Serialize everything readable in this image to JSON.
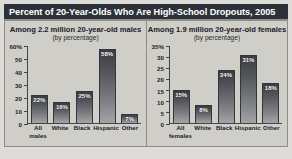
{
  "header": {
    "title": "Percent of 20-Year-Olds Who Are High-School Dropouts, 2005",
    "background_color": "#2d3138",
    "text_color": "#ffffff"
  },
  "figure": {
    "background_color": "#dddcd8",
    "panel_background_color": "#cfcec9",
    "border_color": "#8d8c87",
    "bar_color_top": "#3b3d42",
    "bar_color_bottom": "#a2a4a7",
    "axis_color": "#45464a"
  },
  "chart_data": [
    {
      "type": "bar",
      "title": "Among 2.2 million 20-year-old males",
      "subtitle": "(by percentage)",
      "categories": [
        "All males",
        "White",
        "Black",
        "Hispanic",
        "Other"
      ],
      "category_lines": [
        [
          "All",
          "males"
        ],
        [
          "White",
          ""
        ],
        [
          "Black",
          ""
        ],
        [
          "Hispanic",
          ""
        ],
        [
          "Other",
          ""
        ]
      ],
      "values": [
        22,
        16,
        25,
        58,
        7
      ],
      "value_labels": [
        "22%",
        "16%",
        "25%",
        "58%",
        "7%"
      ],
      "xlabel": "",
      "ylabel": "",
      "ylim": [
        0,
        60
      ],
      "yticks": [
        0,
        10,
        20,
        30,
        40,
        50,
        60
      ],
      "ytick_labels": [
        "0",
        "10",
        "20",
        "30",
        "40",
        "50",
        "60%"
      ],
      "grid": false,
      "legend": "none"
    },
    {
      "type": "bar",
      "title": "Among 1.9 million 20-year-old females",
      "subtitle": "(by percentage)",
      "categories": [
        "All females",
        "White",
        "Black",
        "Hispanic",
        "Other"
      ],
      "category_lines": [
        [
          "All",
          "females"
        ],
        [
          "White",
          ""
        ],
        [
          "Black",
          ""
        ],
        [
          "Hispanic",
          ""
        ],
        [
          "Other",
          ""
        ]
      ],
      "values": [
        15,
        8,
        24,
        31,
        18
      ],
      "value_labels": [
        "15%",
        "8%",
        "24%",
        "31%",
        "18%"
      ],
      "xlabel": "",
      "ylabel": "",
      "ylim": [
        0,
        35
      ],
      "yticks": [
        0,
        5,
        10,
        15,
        20,
        25,
        30,
        35
      ],
      "ytick_labels": [
        "0",
        "5",
        "10",
        "15",
        "20",
        "25",
        "30",
        "35%"
      ],
      "grid": false,
      "legend": "none"
    }
  ]
}
